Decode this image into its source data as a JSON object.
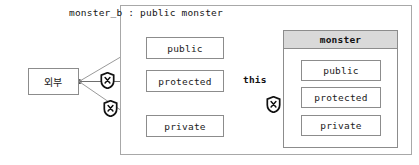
{
  "diagram": {
    "title": "monster_b : public monster",
    "external": {
      "label": "외부"
    },
    "this_ref": {
      "label": "this"
    },
    "outer_members": [
      {
        "label": "public",
        "access": "allowed"
      },
      {
        "label": "protected",
        "access": "blocked"
      },
      {
        "label": "private",
        "access": "blocked"
      }
    ],
    "inner_class": {
      "header": "monster",
      "members": [
        {
          "label": "public",
          "access": "allowed"
        },
        {
          "label": "protected",
          "access": "allowed"
        },
        {
          "label": "private",
          "access": "blocked"
        }
      ]
    },
    "icons": {
      "blocked": "shield-x-icon"
    },
    "colors": {
      "box_border": "#8c8c8c",
      "container_border": "#a8a8a8",
      "header_fill": "#d9d9d9",
      "arrow": "#6e6e6e",
      "shield": "#1a1a1a",
      "text": "#141414",
      "background": "#ffffff"
    }
  }
}
